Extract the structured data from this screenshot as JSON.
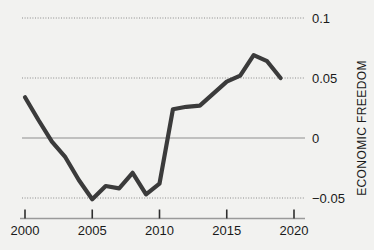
{
  "chart_data": {
    "type": "line",
    "title": "",
    "xlabel": "",
    "ylabel": "ECONOMIC FREEDOM",
    "xlim": [
      1999.3,
      2021.0
    ],
    "ylim": [
      -0.062,
      0.105
    ],
    "grid": true,
    "legend": null,
    "x_ticks": [
      "2000",
      "2005",
      "2010",
      "2015",
      "2020"
    ],
    "x_tick_values": [
      2000,
      2005,
      2010,
      2015,
      2020
    ],
    "y_ticks": [
      "0.1",
      "0.05",
      "0",
      "-0.05"
    ],
    "y_tick_values": [
      0.1,
      0.05,
      0,
      -0.05
    ],
    "y_axis_side": "right",
    "zero_line": 0,
    "line_color": "#3b3b3b",
    "grid_color": "#8a8a8a",
    "axis_color": "#9a9a9a",
    "background": "#f2f2f0",
    "series": [
      {
        "name": "Economic Freedom",
        "x": [
          2000,
          2001,
          2002,
          2003,
          2004,
          2005,
          2006,
          2007,
          2008,
          2009,
          2010,
          2011,
          2012,
          2013,
          2014,
          2015,
          2016,
          2017,
          2018,
          2019
        ],
        "values": [
          0.034,
          0.015,
          -0.003,
          -0.016,
          -0.035,
          -0.051,
          -0.04,
          -0.042,
          -0.029,
          -0.047,
          -0.038,
          0.024,
          0.026,
          0.027,
          0.037,
          0.047,
          0.052,
          0.069,
          0.064,
          0.05
        ]
      }
    ]
  },
  "axis": {
    "vertical_title": "ECONOMIC FREEDOM"
  }
}
